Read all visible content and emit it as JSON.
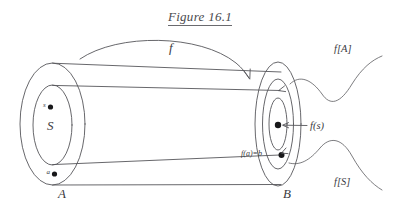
{
  "figure": {
    "title": "Figure 16.1",
    "domain_set": {
      "outer_label": "A",
      "inner_label": "S",
      "points": [
        {
          "name": "s",
          "label": "s"
        },
        {
          "name": "a",
          "label": "a"
        }
      ]
    },
    "codomain_set": {
      "outer_label": "B",
      "image_of_A_label": "f[A]",
      "image_of_S_label": "f[S]",
      "points": [
        {
          "name": "f-of-s",
          "label": "f(s)"
        },
        {
          "name": "f-of-a",
          "label": "f(a)=b"
        }
      ]
    },
    "mapping_label": "f",
    "colors": {
      "ink": "#56565a",
      "dot": "#18181a",
      "text": "#3a3a3e",
      "background": "#ffffff"
    }
  }
}
